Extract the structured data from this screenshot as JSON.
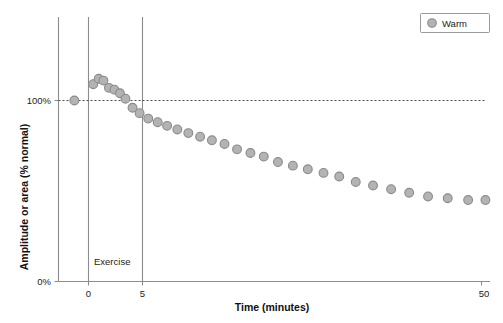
{
  "chart_data": {
    "type": "scatter",
    "title": "",
    "xlabel": "Time (minutes)",
    "ylabel": "Amplitude or area (% normal)",
    "xlim": [
      -3,
      52
    ],
    "ylim": [
      0,
      130
    ],
    "grid": false,
    "legend_position": "top-right",
    "xticks": [
      {
        "value": 0,
        "label": "0"
      },
      {
        "value": 5,
        "label": "5"
      },
      {
        "value": 50,
        "label": "50"
      }
    ],
    "yticks": [
      {
        "value": 0,
        "label": "0%"
      },
      {
        "value": 100,
        "label": "100%"
      }
    ],
    "reference_line": {
      "y": 100,
      "style": "dashed"
    },
    "event_lines": [
      {
        "x": 0,
        "label": ""
      },
      {
        "x": 5,
        "label": ""
      }
    ],
    "annotations": [
      {
        "text": "Exercise",
        "x": 2.5,
        "y": 14
      }
    ],
    "series": [
      {
        "name": "Warm",
        "marker": "circle",
        "color": "#b3b3b3",
        "edge_color": "#8a8a8a",
        "points": [
          {
            "x": -1.8,
            "y": 100
          },
          {
            "x": 0.6,
            "y": 109
          },
          {
            "x": 1.3,
            "y": 112
          },
          {
            "x": 1.9,
            "y": 111
          },
          {
            "x": 2.6,
            "y": 107
          },
          {
            "x": 3.3,
            "y": 106
          },
          {
            "x": 4.0,
            "y": 104
          },
          {
            "x": 4.7,
            "y": 101
          },
          {
            "x": 5.6,
            "y": 96
          },
          {
            "x": 6.5,
            "y": 93
          },
          {
            "x": 7.6,
            "y": 90
          },
          {
            "x": 8.8,
            "y": 88
          },
          {
            "x": 10.0,
            "y": 86
          },
          {
            "x": 11.3,
            "y": 84
          },
          {
            "x": 12.7,
            "y": 82
          },
          {
            "x": 14.2,
            "y": 80
          },
          {
            "x": 15.7,
            "y": 78
          },
          {
            "x": 17.3,
            "y": 76
          },
          {
            "x": 18.9,
            "y": 73
          },
          {
            "x": 20.6,
            "y": 71
          },
          {
            "x": 22.3,
            "y": 69
          },
          {
            "x": 24.1,
            "y": 66
          },
          {
            "x": 26.0,
            "y": 64
          },
          {
            "x": 27.9,
            "y": 62
          },
          {
            "x": 29.9,
            "y": 60
          },
          {
            "x": 31.9,
            "y": 58
          },
          {
            "x": 34.0,
            "y": 55
          },
          {
            "x": 36.2,
            "y": 53
          },
          {
            "x": 38.5,
            "y": 51
          },
          {
            "x": 40.8,
            "y": 49
          },
          {
            "x": 43.2,
            "y": 47
          },
          {
            "x": 45.7,
            "y": 46
          },
          {
            "x": 48.3,
            "y": 45
          },
          {
            "x": 50.5,
            "y": 45
          }
        ]
      }
    ]
  },
  "legend": {
    "entries": [
      {
        "label": "Warm",
        "marker": "circle-marker"
      }
    ]
  }
}
